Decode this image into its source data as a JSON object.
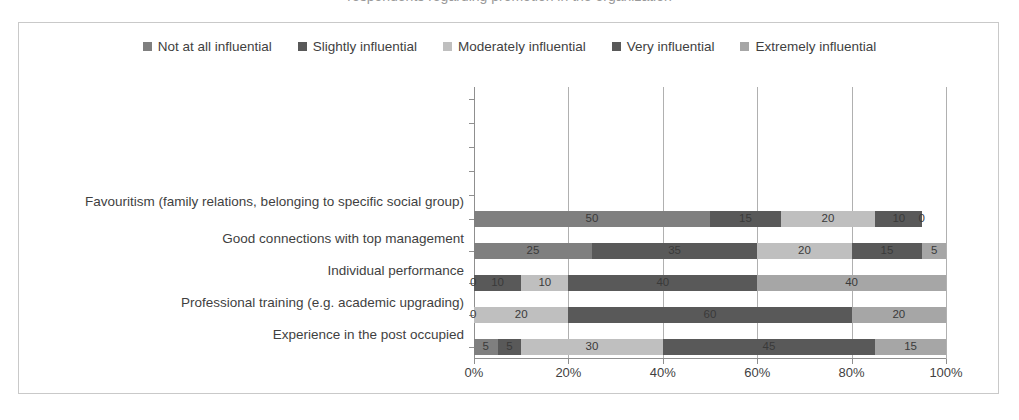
{
  "chart_data": {
    "type": "bar",
    "orientation": "horizontal",
    "stacked": true,
    "stack_mode": "percent",
    "title": "",
    "xlabel": "",
    "ylabel": "",
    "xlim": [
      0,
      100
    ],
    "xticks": [
      "0%",
      "20%",
      "40%",
      "60%",
      "80%",
      "100%"
    ],
    "xtick_values": [
      0,
      20,
      40,
      60,
      80,
      100
    ],
    "grid": true,
    "legend_position": "top",
    "categories": [
      "Favouritism (family relations, belonging to specific social group)",
      "Good connections with top management",
      "Individual performance",
      "Professional training (e.g. academic upgrading)",
      "Experience in the post occupied"
    ],
    "series": [
      {
        "name": "Not at all influential",
        "color": "#7f7f7f",
        "values": [
          50,
          25,
          0,
          0,
          5
        ]
      },
      {
        "name": "Slightly influential",
        "color": "#595959",
        "values": [
          15,
          35,
          10,
          0,
          5
        ]
      },
      {
        "name": "Moderately influential",
        "color": "#bfbfbf",
        "values": [
          20,
          20,
          10,
          20,
          30
        ]
      },
      {
        "name": "Very influential",
        "color": "#595959",
        "values": [
          10,
          15,
          40,
          60,
          45
        ]
      },
      {
        "name": "Extremely influential",
        "color": "#a6a6a6",
        "values": [
          0,
          5,
          40,
          20,
          15
        ]
      }
    ],
    "data_labels": [
      [
        "50",
        "15",
        "20",
        "10",
        "0"
      ],
      [
        "25",
        "35",
        "20",
        "15",
        "5"
      ],
      [
        "0",
        "10",
        "10",
        "40",
        "40"
      ],
      [
        "0",
        "",
        "20",
        "60",
        "20"
      ],
      [
        "5",
        "5",
        "30",
        "45",
        "15"
      ]
    ]
  },
  "legend": {
    "items": [
      {
        "label": "Not at all influential",
        "color": "#7f7f7f"
      },
      {
        "label": "Slightly influential",
        "color": "#595959"
      },
      {
        "label": "Moderately influential",
        "color": "#bfbfbf"
      },
      {
        "label": "Very influential",
        "color": "#595959"
      },
      {
        "label": "Extremely influential",
        "color": "#a6a6a6"
      }
    ]
  },
  "colors": {
    "frame_border": "#c9c9c9",
    "gridline": "#b0b0b0",
    "axis": "#8f8f8f",
    "text": "#3f3f3f"
  }
}
